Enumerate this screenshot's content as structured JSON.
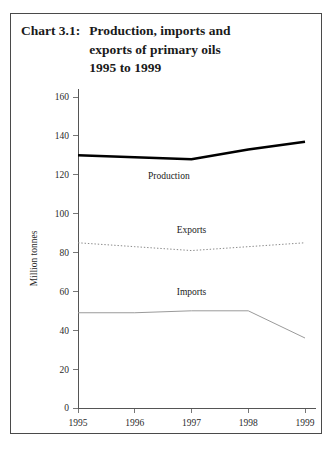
{
  "figure": {
    "chart_number": "Chart 3.1:",
    "title_lines": [
      "Production, imports and",
      "exports of primary oils",
      "1995 to 1999"
    ]
  },
  "chart_data": {
    "type": "line",
    "title": "Chart 3.1: Production, imports and exports of primary oils 1995 to 1999",
    "xlabel": "",
    "ylabel": "Million tonnes",
    "categories": [
      "1995",
      "1996",
      "1997",
      "1998",
      "1999"
    ],
    "x": [
      1995,
      1996,
      1997,
      1998,
      1999
    ],
    "ylim": [
      0,
      160
    ],
    "yticks": [
      0,
      20,
      40,
      60,
      80,
      100,
      120,
      140,
      160
    ],
    "ytick_labels": [
      "0",
      "20",
      "40",
      "60",
      "80",
      "100",
      "120",
      "140",
      "160"
    ],
    "xtick_labels": [
      "1995",
      "1996",
      "1997",
      "1998",
      "1999"
    ],
    "grid": false,
    "legend": "inline-annotations",
    "series": [
      {
        "name": "Production",
        "style": "thick-solid",
        "color": "#000000",
        "values": [
          130,
          129,
          128,
          133,
          137
        ],
        "label_x": 1996.6,
        "label_y": 118
      },
      {
        "name": "Exports",
        "style": "dotted",
        "color": "#8a8a8a",
        "values": [
          85,
          83,
          81,
          83,
          85
        ],
        "label_x": 1997.0,
        "label_y": 90
      },
      {
        "name": "Imports",
        "style": "thin-solid",
        "color": "#9a9a9a",
        "values": [
          49,
          49,
          50,
          50,
          36
        ],
        "label_x": 1997.0,
        "label_y": 58
      }
    ]
  }
}
